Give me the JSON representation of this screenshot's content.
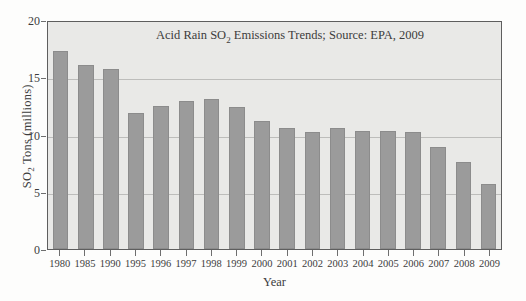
{
  "chart_data": {
    "type": "bar",
    "title": "Acid Rain SO2 Emissions Trends; Source: EPA, 2009",
    "title_prefix": "Acid Rain SO",
    "title_sub": "2",
    "title_suffix": " Emissions Trends; Source: EPA, 2009",
    "xlabel": "Year",
    "ylabel": "SO2 Tons (millions)",
    "ylabel_prefix": "SO",
    "ylabel_sub": "2",
    "ylabel_suffix": " Tons (millions)",
    "categories": [
      "1980",
      "1985",
      "1990",
      "1995",
      "1996",
      "1997",
      "1998",
      "1999",
      "2000",
      "2001",
      "2002",
      "2003",
      "2004",
      "2005",
      "2006",
      "2007",
      "2008",
      "2009"
    ],
    "values": [
      17.3,
      16.1,
      15.7,
      11.9,
      12.5,
      12.9,
      13.1,
      12.4,
      11.2,
      10.6,
      10.2,
      10.6,
      10.3,
      10.3,
      10.2,
      8.9,
      7.6,
      5.7
    ],
    "ylim": [
      0,
      20
    ],
    "yticks": [
      0,
      5,
      10,
      15,
      20
    ],
    "ytick_labels": [
      "0",
      "5",
      "10",
      "15",
      "20"
    ],
    "grid": true,
    "legend": false,
    "bar_color": "#9b9b9b",
    "plot_background": "#e9e9e7",
    "gridline_color": "#bdbdbb",
    "axis_color": "#5e5e5e",
    "text_color": "#3c3c3c"
  }
}
